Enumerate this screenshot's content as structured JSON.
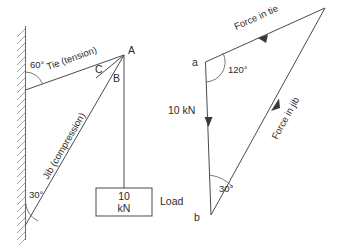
{
  "figure": {
    "background_color": "#ffffff",
    "line_color": "#4a4a4a",
    "text_color": "#2b2b2b"
  },
  "space_diagram": {
    "name": "jib-crane-space-diagram",
    "wall": {
      "label": "hatched-wall"
    },
    "members": [
      {
        "id": "tie",
        "label": "Tie (tension)",
        "angle_label": "60°"
      },
      {
        "id": "jib",
        "label": "Jib (compression)",
        "angle_label": "30°"
      }
    ],
    "angles": [
      {
        "id": "tie-angle",
        "value": "60°"
      },
      {
        "id": "jib-angle",
        "value": "30°"
      }
    ],
    "points": [
      {
        "id": "A",
        "label": "A"
      },
      {
        "id": "B",
        "label": "B"
      },
      {
        "id": "C",
        "label": "C"
      }
    ],
    "load": {
      "value": "10",
      "unit": "kN",
      "label": "Load"
    }
  },
  "force_triangle": {
    "name": "force-triangle-diagram",
    "points": [
      {
        "id": "a",
        "label": "a"
      },
      {
        "id": "b",
        "label": "b"
      }
    ],
    "vectors": [
      {
        "id": "tie-force",
        "label": "Force in tie"
      },
      {
        "id": "jib-force",
        "label": "Force in jib"
      },
      {
        "id": "load-force",
        "label": "10 kN"
      }
    ],
    "angles": [
      {
        "id": "angle-at-a",
        "value": "120°"
      },
      {
        "id": "angle-at-b",
        "value": "30°"
      }
    ]
  }
}
